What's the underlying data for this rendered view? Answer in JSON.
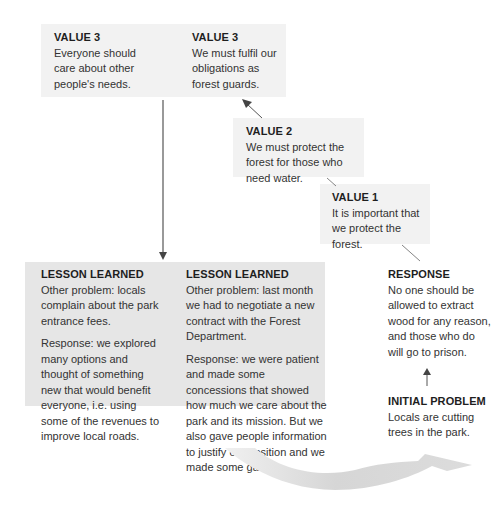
{
  "colors": {
    "box_light": "#f2f2f2",
    "box_dark": "#e6e6e6",
    "arrow": "#555555",
    "curve_arrow": "#d9d9d9",
    "text": "#333333"
  },
  "values": {
    "value3_left": {
      "heading": "VALUE 3",
      "text": "Everyone should care about other people's needs."
    },
    "value3_right": {
      "heading": "VALUE 3",
      "text": "We must fulfil our obligations as forest guards."
    },
    "value2": {
      "heading": "VALUE 2",
      "text": "We must protect the forest for those who need water."
    },
    "value1": {
      "heading": "VALUE 1",
      "text": "It is important that we protect the forest."
    }
  },
  "lessons": {
    "left": {
      "heading": "LESSON LEARNED",
      "problem": "Other problem: locals complain about the park entrance fees.",
      "response": "Response: we explored many options and thought of something new that would benefit everyone, i.e. using some of the revenues to improve local roads."
    },
    "right": {
      "heading": "LESSON LEARNED",
      "problem": "Other problem: last month we had to negotiate a new contract with the Forest Department.",
      "response": "Response: we were patient and made some concessions that showed how much we care about the park and its mission. But we also gave people information to justify our position and we made some gains."
    }
  },
  "response": {
    "heading": "RESPONSE",
    "text": "No one should be allowed to extract wood for any reason, and those who do will go to prison."
  },
  "initial_problem": {
    "heading": "INITIAL PROBLEM",
    "text": "Locals are cutting trees in the park."
  }
}
